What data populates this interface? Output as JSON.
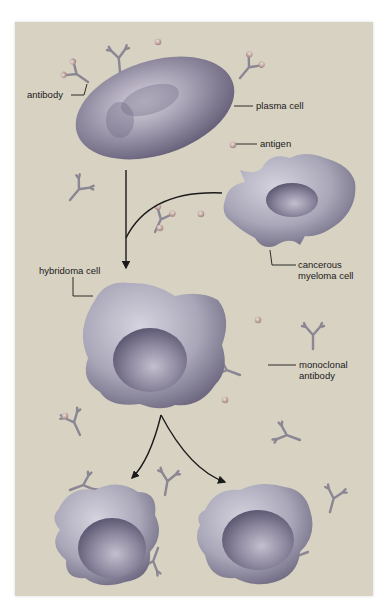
{
  "diagram": {
    "colors": {
      "background": "#d8d2c2",
      "cell_fill": "#a9a6b8",
      "cell_shadow": "#6f6a82",
      "cell_highlight": "#d6d3df",
      "antibody": "#8a8694",
      "antigen": "#c9a9a4",
      "arrow": "#1a1a1a",
      "leader_line": "#1a1a1a"
    },
    "labels": {
      "antibody": "antibody",
      "plasma_cell": "plasma cell",
      "antigen": "antigen",
      "myeloma_line1": "cancerous",
      "myeloma_line2": "myeloma cell",
      "hybridoma_cell": "hybridoma cell",
      "monoclonal_line1": "monoclonal",
      "monoclonal_line2": "antibody"
    },
    "elements": [
      {
        "name": "plasma cell",
        "shape": "ellipse"
      },
      {
        "name": "cancerous myeloma cell",
        "shape": "irregular"
      },
      {
        "name": "hybridoma cell",
        "shape": "irregular"
      },
      {
        "name": "daughter hybridoma cell left",
        "shape": "irregular"
      },
      {
        "name": "daughter hybridoma cell right",
        "shape": "irregular"
      }
    ],
    "flow": [
      "plasma cell + cancerous myeloma cell -> hybridoma cell",
      "hybridoma cell -> 2 daughter hybridoma cells"
    ]
  }
}
